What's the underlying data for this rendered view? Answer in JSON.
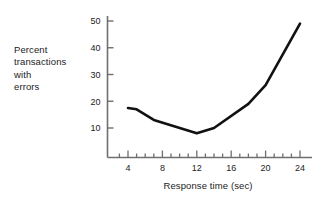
{
  "chart_data": {
    "type": "line",
    "title": "",
    "xlabel": "Response time (sec)",
    "ylabel": "Percent transactions with errors",
    "ylabel_lines": [
      "Percent",
      "transactions",
      "with",
      "errors"
    ],
    "x": [
      4,
      5,
      7,
      12,
      14,
      18,
      20,
      24
    ],
    "values": [
      17.5,
      17,
      13,
      8,
      10,
      19,
      26,
      49
    ],
    "series": [
      {
        "name": "Percent transactions with errors",
        "x": [
          4,
          5,
          7,
          12,
          14,
          18,
          20,
          24
        ],
        "values": [
          17.5,
          17,
          13,
          8,
          10,
          19,
          26,
          49
        ]
      }
    ],
    "xlim": [
      2,
      25
    ],
    "ylim": [
      0,
      53
    ],
    "xticks": [
      4,
      8,
      12,
      16,
      20,
      24
    ],
    "xtick_labels": [
      "4",
      "8",
      "12",
      "16",
      "20",
      "24"
    ],
    "x_minor_ticks": [
      3,
      4,
      5,
      6,
      7,
      8,
      9,
      10,
      11,
      12,
      13,
      14,
      15,
      16,
      17,
      18,
      19,
      20,
      21,
      22,
      23,
      24
    ],
    "yticks": [
      10,
      20,
      30,
      40,
      50
    ],
    "ytick_labels": [
      "10",
      "20",
      "30",
      "40",
      "50"
    ],
    "grid": false,
    "legend": "none",
    "line_color": "#111111",
    "axis_color": "#6f6f6f",
    "background": "#ffffff"
  },
  "axes": {
    "x_axis_name": "response-time-axis",
    "y_axis_name": "percent-errors-axis"
  }
}
